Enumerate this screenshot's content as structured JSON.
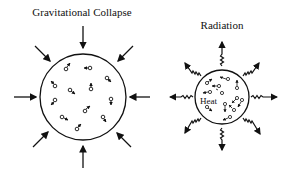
{
  "panels": {
    "left": {
      "title": "Gravitational Collapse",
      "circle": {
        "cx": 83,
        "cy": 97,
        "r": 43
      },
      "arrow_color": "#111111",
      "particle_symbol": "♂",
      "particle_count": 14
    },
    "right": {
      "title": "Radiation",
      "inner_label": "Heat",
      "circle": {
        "cx": 222,
        "cy": 97,
        "r": 27
      },
      "ray_count": 8
    }
  }
}
